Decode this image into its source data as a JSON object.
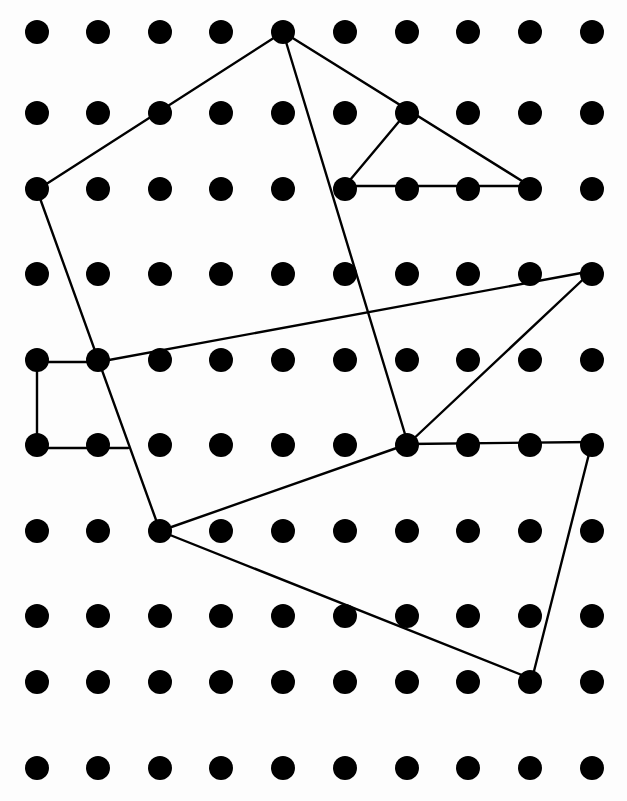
{
  "diagram": {
    "type": "dot-grid-with-polylines",
    "grid": {
      "columns": 10,
      "rows": 10,
      "column_x": [
        37,
        98,
        160,
        221,
        283,
        345,
        407,
        468,
        530,
        592
      ],
      "row_y": [
        32,
        113,
        189,
        274,
        360,
        445,
        531,
        616,
        682,
        768
      ],
      "dot_radius": 12,
      "dot_color": "#000000"
    },
    "line_color": "#000000",
    "line_width": 2.4,
    "segments": [
      {
        "from": [
          37,
          190
        ],
        "to": [
          283,
          32
        ]
      },
      {
        "from": [
          283,
          32
        ],
        "to": [
          530,
          186
        ]
      },
      {
        "from": [
          283,
          32
        ],
        "to": [
          408,
          444
        ]
      },
      {
        "from": [
          345,
          186
        ],
        "to": [
          407,
          112
        ]
      },
      {
        "from": [
          345,
          186
        ],
        "to": [
          530,
          186
        ]
      },
      {
        "from": [
          37,
          190
        ],
        "to": [
          160,
          531
        ]
      },
      {
        "from": [
          37,
          362
        ],
        "to": [
          98,
          362
        ]
      },
      {
        "from": [
          37,
          362
        ],
        "to": [
          37,
          448
        ]
      },
      {
        "from": [
          37,
          448
        ],
        "to": [
          128,
          448
        ]
      },
      {
        "from": [
          98,
          362
        ],
        "to": [
          592,
          271
        ]
      },
      {
        "from": [
          592,
          271
        ],
        "to": [
          408,
          444
        ]
      },
      {
        "from": [
          408,
          444
        ],
        "to": [
          592,
          442
        ]
      },
      {
        "from": [
          160,
          531
        ],
        "to": [
          408,
          444
        ]
      },
      {
        "from": [
          160,
          531
        ],
        "to": [
          532,
          679
        ]
      },
      {
        "from": [
          592,
          442
        ],
        "to": [
          532,
          679
        ]
      }
    ]
  }
}
